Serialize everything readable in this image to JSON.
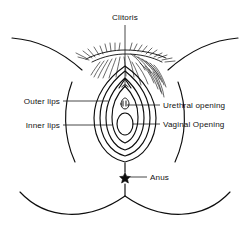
{
  "diagram": {
    "background_color": "#ffffff",
    "line_color": "#0d0d0d",
    "text_color": "#111111",
    "style": "black and white line drawing"
  },
  "labels": {
    "clitoris": "Clitoris",
    "outer_lips": "Outer lips",
    "inner_lips": "Inner lips",
    "urethral_opening": "Urethral opening",
    "vaginal_opening": "Vaginal Opening",
    "anus": "Anus"
  },
  "markers": {
    "anus_marker": "star",
    "clitoris_marker": "triangle",
    "urethra_marker": "small-oval"
  },
  "parts": [
    {
      "name": "clitoris",
      "label": "Clitoris",
      "position": "top-center",
      "leader": "vertical"
    },
    {
      "name": "outer-lips",
      "label": "Outer lips",
      "position": "left",
      "leader": "horizontal"
    },
    {
      "name": "inner-lips",
      "label": "Inner lips",
      "position": "left",
      "leader": "horizontal"
    },
    {
      "name": "urethral-opening",
      "label": "Urethral opening",
      "position": "right",
      "leader": "horizontal"
    },
    {
      "name": "vaginal-opening",
      "label": "Vaginal Opening",
      "position": "right",
      "leader": "horizontal"
    },
    {
      "name": "anus",
      "label": "Anus",
      "position": "bottom-center",
      "leader": "horizontal"
    }
  ]
}
